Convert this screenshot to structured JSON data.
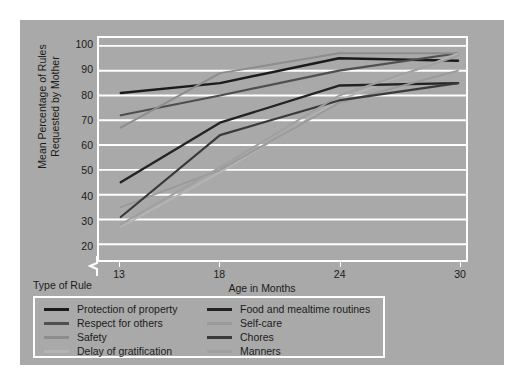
{
  "figure": {
    "background_color": "#a9a9a9",
    "page_color": "#ffffff",
    "grid_color": "#ffffff",
    "text_color": "#1b1b1b"
  },
  "legend": {
    "title": "Type of Rule",
    "columns": [
      {
        "items": [
          {
            "label": "Protection of property",
            "color": "#1b1b1b"
          },
          {
            "label": "Respect for others",
            "color": "#4f4f4f"
          },
          {
            "label": "Safety",
            "color": "#8d8d8d"
          },
          {
            "label": "Delay of gratification",
            "color": "#b4b4b4"
          }
        ]
      },
      {
        "items": [
          {
            "label": "Food and mealtime routines",
            "color": "#232323"
          },
          {
            "label": "Self-care",
            "color": "#9a9a9a"
          },
          {
            "label": "Chores",
            "color": "#3a3a3a"
          },
          {
            "label": "Manners",
            "color": "#a0a0a0"
          }
        ]
      }
    ]
  },
  "chart_data": {
    "type": "line",
    "title": "",
    "xlabel": "Age in Months",
    "ylabel": "Mean Percentage of Rules Requested by Mother",
    "x": [
      13,
      18,
      24,
      30
    ],
    "xtick_labels": [
      "13",
      "18",
      "24",
      "30"
    ],
    "ytick_labels": [
      "20",
      "30",
      "40",
      "50",
      "60",
      "70",
      "80",
      "90",
      "100"
    ],
    "yticks": [
      20,
      30,
      40,
      50,
      60,
      70,
      80,
      90,
      100
    ],
    "ylim": [
      20,
      100
    ],
    "axis_break": true,
    "grid": true,
    "grid_axis": "y",
    "legend_position": "below",
    "series": [
      {
        "name": "Protection of property",
        "color": "#1b1b1b",
        "width": 2.4,
        "values": [
          81,
          85,
          95,
          94
        ]
      },
      {
        "name": "Respect for others",
        "color": "#4f4f4f",
        "width": 2.2,
        "values": [
          72,
          80,
          90,
          97
        ]
      },
      {
        "name": "Safety",
        "color": "#8d8d8d",
        "width": 2.0,
        "values": [
          67,
          89,
          97,
          97
        ]
      },
      {
        "name": "Delay of gratification",
        "color": "#b4b4b4",
        "width": 2.0,
        "values": [
          27,
          49,
          78,
          97
        ]
      },
      {
        "name": "Food and mealtime routines",
        "color": "#232323",
        "width": 2.4,
        "values": [
          45,
          69,
          84,
          85
        ]
      },
      {
        "name": "Self-care",
        "color": "#9a9a9a",
        "width": 2.0,
        "values": [
          35,
          50,
          77,
          90
        ]
      },
      {
        "name": "Chores",
        "color": "#3a3a3a",
        "width": 2.2,
        "values": [
          31,
          64,
          78,
          85
        ]
      },
      {
        "name": "Manners",
        "color": "#a0a0a0",
        "width": 2.0,
        "values": [
          28,
          51,
          80,
          96
        ]
      }
    ]
  }
}
